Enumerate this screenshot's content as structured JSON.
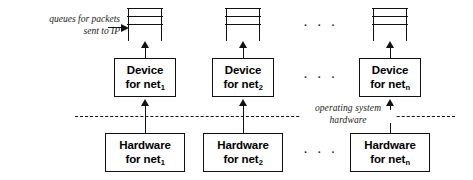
{
  "figure": {
    "annotations": {
      "queue_label_line1": "queues for packets",
      "queue_label_line2": "sent to IP",
      "boundary_label_line1": "operating system",
      "boundary_label_line2": "hardware"
    },
    "ellipsis": "· · ·",
    "columns": [
      {
        "id": "net1",
        "queue_name": "packet-queue-net1",
        "device_line1": "Device",
        "device_line2": "for net",
        "device_subscript": "1",
        "hardware_line1": "Hardware",
        "hardware_line2": "for net",
        "hardware_subscript": "1"
      },
      {
        "id": "net2",
        "queue_name": "packet-queue-net2",
        "device_line1": "Device",
        "device_line2": "for net",
        "device_subscript": "2",
        "hardware_line1": "Hardware",
        "hardware_line2": "for net",
        "hardware_subscript": "2"
      },
      {
        "id": "netn",
        "queue_name": "packet-queue-netn",
        "device_line1": "Device",
        "device_line2": "for net",
        "device_subscript": "n",
        "hardware_line1": "Hardware",
        "hardware_line2": "for net",
        "hardware_subscript": "n"
      }
    ],
    "colors": {
      "stroke": "#111111",
      "background": "#ffffff",
      "text": "#000000"
    }
  }
}
